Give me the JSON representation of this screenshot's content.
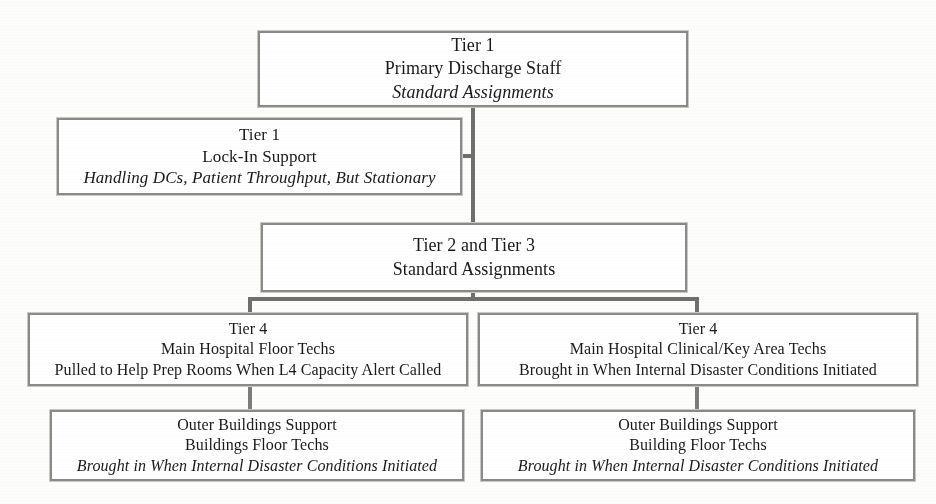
{
  "diagram": {
    "border_color": "#8a8a88",
    "connector_color": "#6f6f6d",
    "background_color": "#ffffff",
    "nodes": [
      {
        "id": "tier1-primary",
        "line1": "Tier 1",
        "line2": "Primary Discharge Staff",
        "line3": "Standard Assignments",
        "line3_italic": true
      },
      {
        "id": "tier1-lockin",
        "line1": "Tier 1",
        "line2": "Lock-In Support",
        "line3": "Handling DCs, Patient Throughput, But Stationary",
        "line3_italic": true
      },
      {
        "id": "tier2-tier3",
        "line1": "Tier 2 and Tier 3",
        "line2": "Standard Assignments",
        "line3": "",
        "line3_italic": false
      },
      {
        "id": "tier4-main-floor",
        "line1": "Tier 4",
        "line2": "Main Hospital Floor Techs",
        "line3": "Pulled to Help Prep Rooms When L4 Capacity Alert Called",
        "line3_italic": false
      },
      {
        "id": "tier4-clinical-key",
        "line1": "Tier 4",
        "line2": "Main Hospital Clinical/Key Area Techs",
        "line3": "Brought in When Internal Disaster Conditions Initiated",
        "line3_italic": false
      },
      {
        "id": "outer-buildings-left",
        "line1": "Outer Buildings Support",
        "line2": "Buildings Floor Techs",
        "line3": "Brought in When Internal Disaster Conditions Initiated",
        "line3_italic": true
      },
      {
        "id": "outer-buildings-right",
        "line1": "Outer Buildings Support",
        "line2": "Building Floor Techs",
        "line3": "Brought in When Internal Disaster Conditions Initiated",
        "line3_italic": true
      }
    ]
  }
}
